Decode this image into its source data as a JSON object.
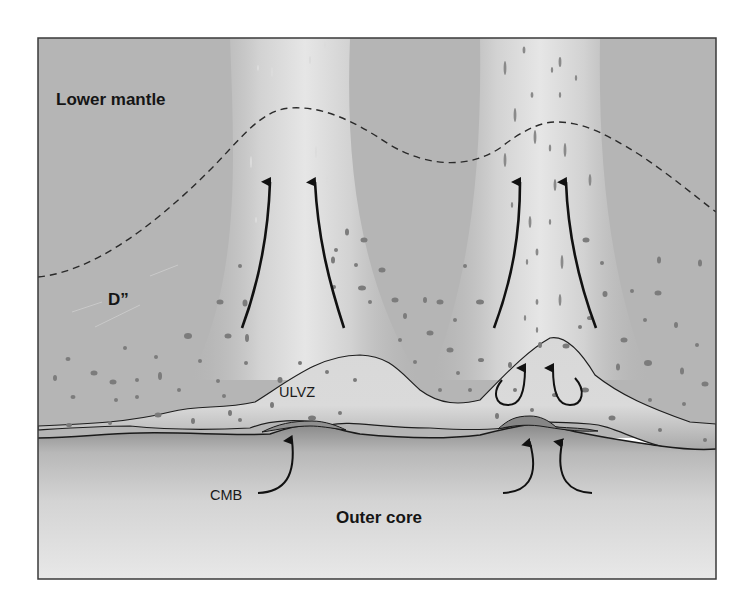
{
  "diagram": {
    "type": "cross-section",
    "labels": {
      "lower_mantle": "Lower mantle",
      "d_double_prime": "D”",
      "ulvz": "ULVZ",
      "cmb": "CMB",
      "outer_core": "Outer core"
    },
    "layers": [
      {
        "name": "Lower mantle",
        "position": "top"
      },
      {
        "name": "D”",
        "position": "above CMB, bounded by dashed line"
      },
      {
        "name": "ULVZ",
        "position": "lens-shaped zones sitting on CMB"
      },
      {
        "name": "CMB",
        "position": "core-mantle boundary line"
      },
      {
        "name": "Outer core",
        "position": "bottom"
      }
    ],
    "plumes": [
      {
        "id": "left",
        "arrows": 2,
        "direction": "upward"
      },
      {
        "id": "right",
        "arrows": 2,
        "direction": "upward",
        "internal_circulation_arrows": 2,
        "core_upwelling_arrows": 2
      }
    ],
    "colors": {
      "mantle": "#b4b4b4",
      "plume": "#e2e2e2",
      "ulvz": "#d4d4d4",
      "core_top": "#8e8e8e",
      "core_bottom": "#e6e6e6",
      "dots": "#7a7a7a",
      "lines": "#1e1e1e",
      "frame": "#3a3a3a"
    }
  }
}
